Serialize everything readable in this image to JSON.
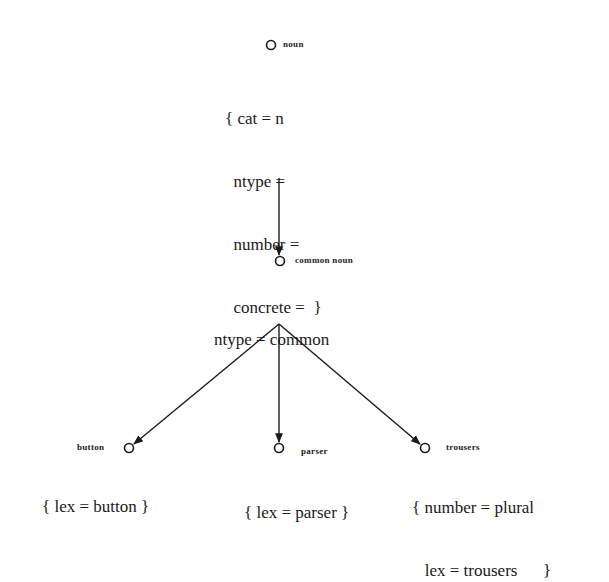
{
  "diagram": {
    "type": "inheritance-hierarchy",
    "nodes": {
      "noun": {
        "label": "noun",
        "features": [
          "{ cat = n",
          "  ntype =",
          "  number =",
          "  concrete =  }"
        ]
      },
      "common_noun": {
        "label": "common noun",
        "features": [
          "ntype = common"
        ]
      },
      "button": {
        "label": "button",
        "features": [
          "{ lex = button }"
        ]
      },
      "parser": {
        "label": "parser",
        "features": [
          "{ lex = parser }"
        ]
      },
      "trousers": {
        "label": "trousers",
        "features": [
          "{ number = plural",
          "   lex = trousers      }"
        ]
      }
    },
    "edges": [
      {
        "from": "noun",
        "to": "common noun"
      },
      {
        "from": "common noun",
        "to": "button"
      },
      {
        "from": "common noun",
        "to": "parser"
      },
      {
        "from": "common noun",
        "to": "trousers"
      }
    ],
    "colors": {
      "ink": "#1a1a1a",
      "background": "#ffffff"
    }
  }
}
